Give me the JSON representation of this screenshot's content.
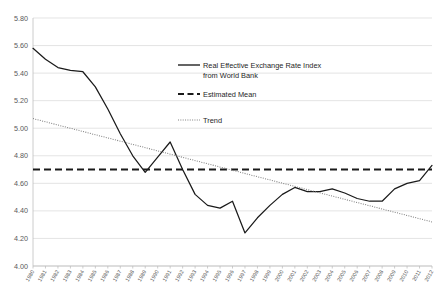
{
  "chart_data": {
    "type": "line",
    "title": "",
    "xlabel": "",
    "ylabel": "",
    "ylim": [
      4.0,
      5.8
    ],
    "ytick_step": 0.2,
    "ytick_labels": [
      "4.00",
      "4.20",
      "4.40",
      "4.60",
      "4.80",
      "5.00",
      "5.20",
      "5.40",
      "5.60",
      "5.80"
    ],
    "grid": true,
    "legend_position": "inside-top-center",
    "categories": [
      "1980",
      "1981",
      "1982",
      "1983",
      "1984",
      "1985",
      "1986",
      "1987",
      "1988",
      "1989",
      "1990",
      "1991",
      "1992",
      "1993",
      "1994",
      "1995",
      "1996",
      "1997",
      "1998",
      "1999",
      "2000",
      "2001",
      "2002",
      "2003",
      "2004",
      "2005",
      "2006",
      "2007",
      "2008",
      "2009",
      "2010",
      "2011",
      "2012"
    ],
    "series": [
      {
        "name": "Real Effective Exchange Rate Index from World Bank",
        "style": "solid",
        "color": "#1a1a1a",
        "values": [
          5.58,
          5.5,
          5.44,
          5.42,
          5.41,
          5.3,
          5.14,
          4.96,
          4.8,
          4.68,
          4.79,
          4.9,
          4.7,
          4.52,
          4.44,
          4.42,
          4.47,
          4.24,
          4.35,
          4.44,
          4.52,
          4.57,
          4.54,
          4.54,
          4.56,
          4.53,
          4.49,
          4.47,
          4.47,
          4.56,
          4.6,
          4.62,
          4.73
        ]
      },
      {
        "name": "Estimated Mean",
        "style": "dashed",
        "color": "#1a1a1a",
        "constant_value": 4.7
      },
      {
        "name": "Trend",
        "style": "dotted",
        "color": "#808080",
        "endpoints": [
          5.07,
          4.32
        ]
      }
    ]
  },
  "legend": {
    "items": [
      {
        "label_line1": "Real Effective Exchange Rate Index",
        "label_line2": "from World Bank",
        "style": "solid"
      },
      {
        "label_line1": "Estimated Mean",
        "label_line2": "",
        "style": "dashed"
      },
      {
        "label_line1": "Trend",
        "label_line2": "",
        "style": "dotted"
      }
    ]
  }
}
